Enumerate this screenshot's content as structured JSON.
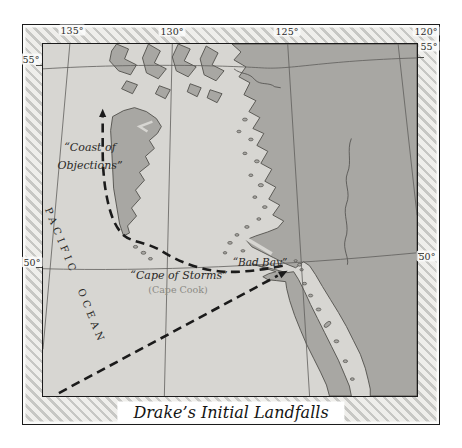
{
  "map": {
    "title": "Drake’s Initial Landfalls",
    "grid": {
      "top": [
        "135°",
        "130°",
        "125°",
        "120°"
      ],
      "left": [
        "55°",
        "50°"
      ],
      "right": [
        "55°",
        "50°"
      ]
    },
    "labels": {
      "ocean": "PACIFIC OCEAN",
      "coast_line1": "“Coast of",
      "coast_line2": "Objections”",
      "cape_storms": "“Cape of Storms”",
      "cape_cook": "(Cape Cook)",
      "bad_bay": "“Bad Bay”"
    },
    "colors": {
      "ocean": "#d7d6d2",
      "land": "#a8a7a3",
      "coast_outline": "#504f4b",
      "route": "#1b1b1b",
      "graticule": "#5f5e5b",
      "border_hatch": "#c7c7c4"
    }
  }
}
